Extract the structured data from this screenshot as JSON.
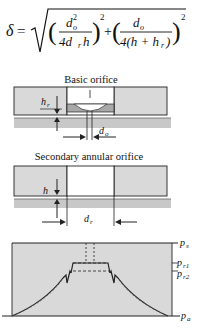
{
  "equation": {
    "lhs": "δ",
    "eq": "=",
    "term1_num": "d",
    "term1_num_sub": "o",
    "term1_num_sup": "2",
    "term1_den": "4d",
    "term1_den_sub": "r",
    "term1_den_tail": "h",
    "term2_num": "d",
    "term2_num_sub": "o",
    "term2_den": "4(h + h",
    "term2_den_sub": "r",
    "term2_den_tail": ")",
    "exp": "2",
    "plus": "+"
  },
  "basic_orifice": {
    "title": "Basic orifice",
    "label_hr": "h",
    "label_hr_sub": "r",
    "label_do": "d",
    "label_do_sub": "o"
  },
  "annular_orifice": {
    "title": "Secondary annular orifice",
    "label_h": "h",
    "label_dr": "d",
    "label_dr_sub": "r"
  },
  "pressure_plot": {
    "labels": {
      "ps": "p",
      "ps_sub": "s",
      "pr1": "p",
      "pr1_sub": "r1",
      "pr2": "p",
      "pr2_sub": "r2",
      "pa": "p",
      "pa_sub": "a"
    }
  },
  "colors": {
    "fill_gray": "#d9d9d9",
    "dark_gray": "#a8a8a8",
    "line": "#222222"
  }
}
